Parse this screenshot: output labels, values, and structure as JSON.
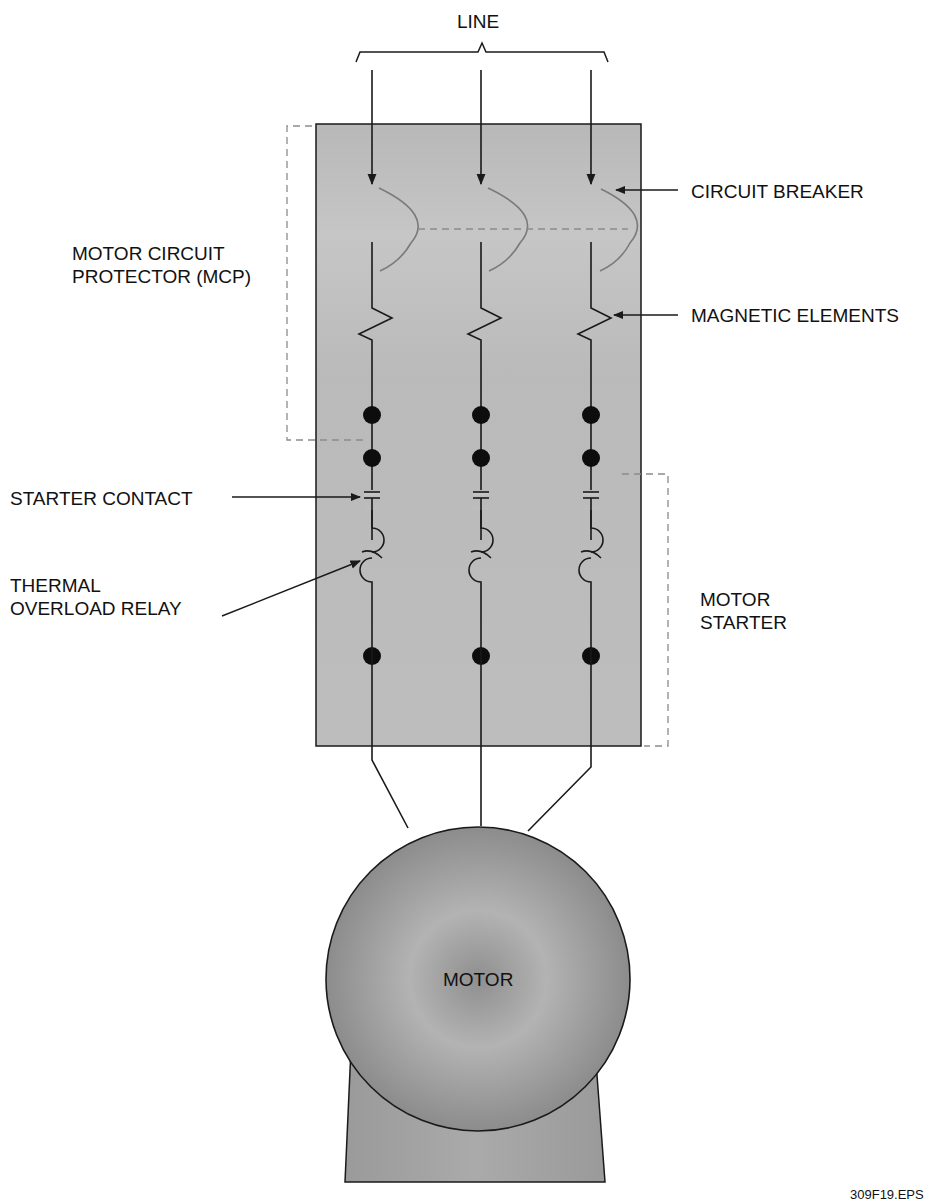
{
  "diagram": {
    "figure_id": "309F19.EPS",
    "labels": {
      "line": "LINE",
      "circuit_breaker": "CIRCUIT BREAKER",
      "magnetic_elements": "MAGNETIC ELEMENTS",
      "mcp_line1": "MOTOR CIRCUIT",
      "mcp_line2": "PROTECTOR (MCP)",
      "starter_contact": "STARTER CONTACT",
      "thermal_line1": "THERMAL",
      "thermal_line2": "OVERLOAD RELAY",
      "motor_starter_line1": "MOTOR",
      "motor_starter_line2": "STARTER",
      "motor": "MOTOR"
    },
    "phases": 3,
    "colors": {
      "panel_fill": "#bdbdbd",
      "motor_fill": "#9a9a9a",
      "line_stroke": "#1a1a1a",
      "dashed_stroke": "#8c8c8c"
    }
  }
}
